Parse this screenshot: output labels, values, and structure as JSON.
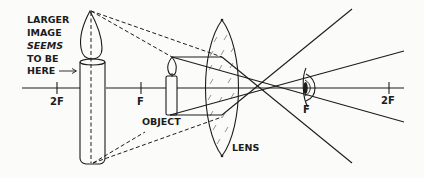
{
  "diagram": {
    "labels": {
      "image_line1": "LARGER",
      "image_line2": "IMAGE",
      "image_line3": "SEEMS",
      "image_line4": "TO BE",
      "image_line5": "HERE",
      "object": "OBJECT",
      "lens": "LENS",
      "left_2f": "2F",
      "left_f": "F",
      "right_f": "F",
      "right_2f": "2F"
    },
    "colors": {
      "ink": "#1c1c1c",
      "paper": "#fbfbf9"
    },
    "elements": {
      "optical_axis": "horizontal principal axis",
      "virtual_image": "large candle (virtual, upright, magnified)",
      "object": "small candle between F and lens",
      "lens": "biconvex lens",
      "eye": "observer eye at right focal point"
    }
  }
}
